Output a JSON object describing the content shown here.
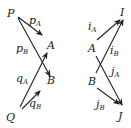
{
  "diagram": {
    "left": {
      "nodes": {
        "P": {
          "label": "P",
          "x": 7,
          "y": 17
        },
        "Q": {
          "label": "Q",
          "x": 6,
          "y": 121
        },
        "A": {
          "label": "A",
          "x": 47,
          "y": 49
        },
        "B": {
          "label": "B",
          "x": 47,
          "y": 84
        }
      },
      "arrows": [
        {
          "id": "pA",
          "base": "p",
          "sub": "A",
          "from": "P",
          "to": "A-direction",
          "x1": 18,
          "y1": 17,
          "x2": 42,
          "y2": 35,
          "lx": 29,
          "ly": 24
        },
        {
          "id": "pB",
          "base": "p",
          "sub": "B",
          "from": "P",
          "to": "B",
          "x1": 18,
          "y1": 18,
          "x2": 50,
          "y2": 76,
          "lx": 16,
          "ly": 52
        },
        {
          "id": "qA",
          "base": "q",
          "sub": "A",
          "from": "Q",
          "to": "A",
          "x1": 20,
          "y1": 107,
          "x2": 47,
          "y2": 53,
          "lx": 16,
          "ly": 82
        },
        {
          "id": "qB",
          "base": "q",
          "sub": "B",
          "from": "Q",
          "to": "B-direction",
          "x1": 22,
          "y1": 109,
          "x2": 40,
          "y2": 91,
          "lx": 29,
          "ly": 107
        }
      ]
    },
    "right": {
      "nodes": {
        "I": {
          "label": "I",
          "x": 120,
          "y": 16
        },
        "J": {
          "label": "J",
          "x": 118,
          "y": 120
        },
        "A": {
          "label": "A",
          "x": 88,
          "y": 52
        },
        "B": {
          "label": "B",
          "x": 88,
          "y": 85
        }
      },
      "arrows": [
        {
          "id": "iA",
          "base": "i",
          "sub": "A",
          "from": "A",
          "to": "I-direction",
          "x1": 97,
          "y1": 40,
          "x2": 120,
          "y2": 20,
          "lx": 88,
          "ly": 30
        },
        {
          "id": "iB",
          "base": "i",
          "sub": "B",
          "from": "B",
          "to": "I",
          "x1": 96,
          "y1": 73,
          "x2": 123,
          "y2": 20,
          "lx": 110,
          "ly": 54
        },
        {
          "id": "jA",
          "base": "j",
          "sub": "A",
          "from": "A",
          "to": "J",
          "x1": 96,
          "y1": 56,
          "x2": 122,
          "y2": 105,
          "lx": 111,
          "ly": 75
        },
        {
          "id": "jB",
          "base": "j",
          "sub": "B",
          "from": "B",
          "to": "J-direction",
          "x1": 97,
          "y1": 88,
          "x2": 119,
          "y2": 104,
          "lx": 96,
          "ly": 108
        }
      ]
    }
  }
}
